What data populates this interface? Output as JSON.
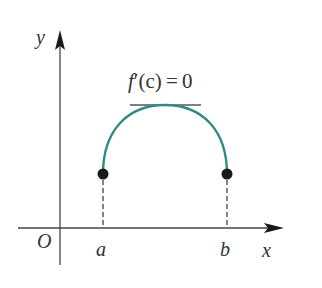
{
  "diagram": {
    "axes": {
      "x_label": "x",
      "y_label": "y",
      "origin_label": "O",
      "axis_color": "#444444"
    },
    "points": [
      {
        "label": "a",
        "x_px": 103,
        "y_px": 174
      },
      {
        "label": "b",
        "x_px": 227,
        "y_px": 174
      }
    ],
    "curve": {
      "color": "#2e8a8a",
      "description": "arch from a to b with maximum at c"
    },
    "tangent": {
      "label_f": "f",
      "label_rest": "′(c) = 0",
      "color": "#555555"
    },
    "point_color": "#1a1a1a"
  }
}
